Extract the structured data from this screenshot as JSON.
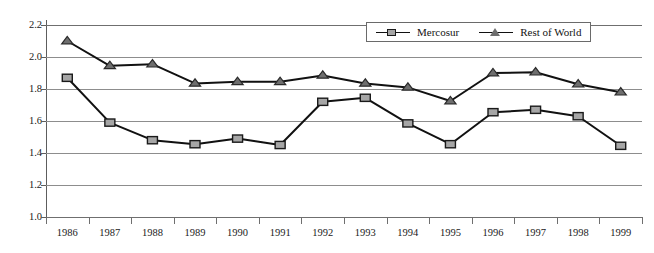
{
  "chart_data": {
    "type": "line",
    "title": "",
    "xlabel": "",
    "ylabel": "",
    "categories": [
      "1986",
      "1987",
      "1988",
      "1989",
      "1990",
      "1991",
      "1992",
      "1993",
      "1994",
      "1995",
      "1996",
      "1997",
      "1998",
      "1999"
    ],
    "ylim": [
      1.0,
      2.2
    ],
    "y_ticks": [
      "1.0",
      "1.2",
      "1.4",
      "1.6",
      "1.8",
      "2.0",
      "2.2"
    ],
    "y_tick_values": [
      1.0,
      1.2,
      1.4,
      1.6,
      1.8,
      2.0,
      2.2
    ],
    "grid": true,
    "legend_position": "top-right",
    "series": [
      {
        "name": "Mercosur",
        "marker": "square",
        "color": "#a6a6a6",
        "line_color": "#111111",
        "values": [
          1.87,
          1.59,
          1.48,
          1.455,
          1.49,
          1.45,
          1.72,
          1.745,
          1.585,
          1.455,
          1.655,
          1.67,
          1.63,
          1.445
        ]
      },
      {
        "name": "Rest of World",
        "marker": "triangle",
        "color": "#6e6e6e",
        "line_color": "#111111",
        "values": [
          2.1,
          1.945,
          1.955,
          1.835,
          1.845,
          1.845,
          1.885,
          1.835,
          1.81,
          1.725,
          1.9,
          1.905,
          1.83,
          1.78
        ]
      }
    ]
  },
  "legend": {
    "entries": [
      {
        "label": "Mercosur",
        "marker": "square-marker-icon"
      },
      {
        "label": "Rest of World",
        "marker": "triangle-marker-icon"
      }
    ]
  }
}
